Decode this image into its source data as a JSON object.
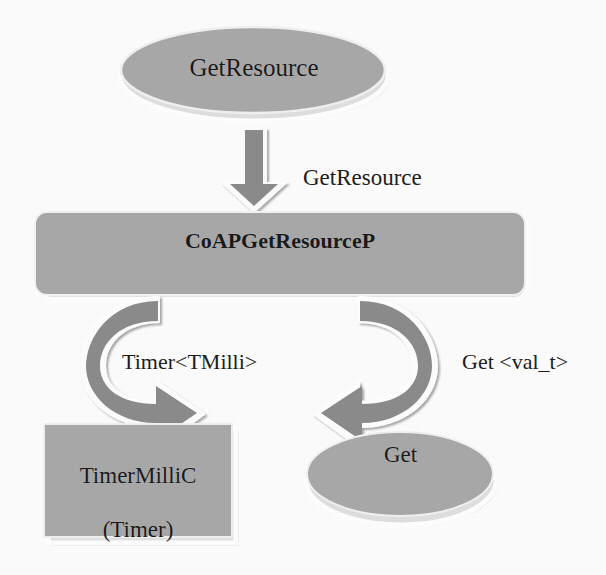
{
  "diagram": {
    "background_color": "#fdfdfd",
    "shape_fill": "#a9a9a9",
    "shape_outline": "#ffffff",
    "arrow_fill": "#8c8c8c",
    "text_color": "#1a1a1a",
    "nodes": {
      "provided_interface": {
        "label": "GetResource",
        "shape": "ellipse"
      },
      "module": {
        "label": "CoAPGetResourceP",
        "shape": "rounded-rectangle"
      },
      "timer_component": {
        "label": "TimerMilliC\n(Timer)",
        "line1": "TimerMilliC",
        "line2": "(Timer)",
        "shape": "rectangle"
      },
      "get_interface": {
        "label": "Get",
        "shape": "ellipse"
      }
    },
    "edges": {
      "provides": {
        "label": "GetResource",
        "arrow": "down-block-arrow",
        "from": "GetResource",
        "to": "CoAPGetResourceP"
      },
      "uses_timer": {
        "label": "Timer<TMilli>",
        "arrow": "curved-arrow-left",
        "from": "CoAPGetResourceP",
        "to": "TimerMilliC"
      },
      "uses_get": {
        "label": "Get <val_t>",
        "arrow": "curved-arrow-right",
        "from": "CoAPGetResourceP",
        "to": "Get"
      }
    }
  }
}
